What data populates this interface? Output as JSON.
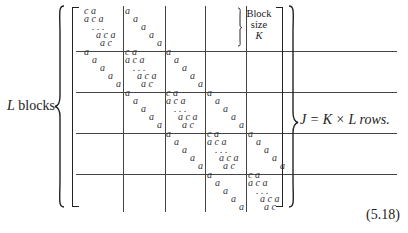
{
  "equation": {
    "left_label_var": "L",
    "left_label_text": " blocks",
    "right_label": "J = K × L rows.",
    "equation_number": "(5.18)",
    "block_note": [
      "Block",
      "size",
      "K"
    ],
    "block_count": 5,
    "diag_block": {
      "rows": [
        "c a",
        "a c a",
        ". . .",
        "a c a",
        "a c"
      ]
    },
    "off_diag_block": {
      "entries": [
        "a",
        "a",
        "a",
        "a",
        "a"
      ]
    }
  }
}
